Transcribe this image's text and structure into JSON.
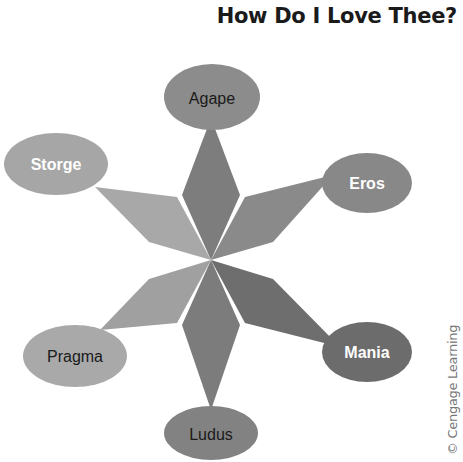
{
  "title": "How Do I Love Thee?",
  "credit": "© Cengage Learning",
  "center": {
    "x": 211,
    "y": 260
  },
  "nodes": [
    {
      "id": "agape",
      "label": "Agape",
      "text_color": "#1a1a1a",
      "bold": false,
      "fill": "#8c8c8c",
      "petal_fill": "#7d7d7d"
    },
    {
      "id": "eros",
      "label": "Eros",
      "text_color": "#ffffff",
      "bold": true,
      "fill": "#888888",
      "petal_fill": "#8a8a8a"
    },
    {
      "id": "mania",
      "label": "Mania",
      "text_color": "#ffffff",
      "bold": true,
      "fill": "#6c6c6c",
      "petal_fill": "#6e6e6e"
    },
    {
      "id": "ludus",
      "label": "Ludus",
      "text_color": "#1a1a1a",
      "bold": false,
      "fill": "#828282",
      "petal_fill": "#7c7c7c"
    },
    {
      "id": "pragma",
      "label": "Pragma",
      "text_color": "#1a1a1a",
      "bold": false,
      "fill": "#a9a9a9",
      "petal_fill": "#a0a0a0"
    },
    {
      "id": "storge",
      "label": "Storge",
      "text_color": "#ffffff",
      "bold": true,
      "fill": "#a6a6a6",
      "petal_fill": "#a8a8a8"
    }
  ]
}
